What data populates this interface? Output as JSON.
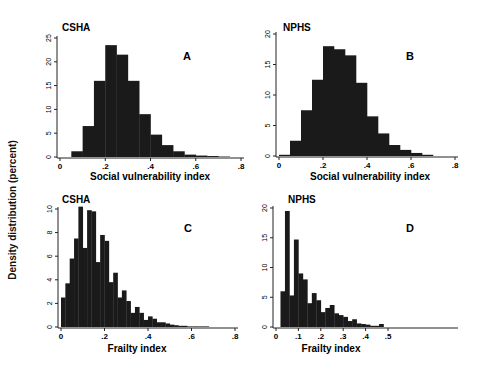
{
  "figure": {
    "ylabel": "Density distribution (percent)",
    "bar_color": "#1a1a1a",
    "axis_color": "#222222"
  },
  "chart_data": [
    {
      "type": "bar",
      "panel": "A",
      "title": "CSHA",
      "xlabel": "Social vulnerability index",
      "ylabel": "Density distribution (percent)",
      "xlim": [
        0,
        0.8
      ],
      "ylim": [
        0,
        25
      ],
      "xticks": [
        "0",
        ".2",
        ".4",
        ".6",
        ".8"
      ],
      "yticks": [
        "0",
        "5",
        "10",
        "15",
        "20",
        "25"
      ],
      "bin_width": 0.05,
      "bin_start": 0.05,
      "values": [
        1.2,
        6.5,
        16,
        23.5,
        21.5,
        16,
        9,
        4.7,
        2.5,
        1.2,
        0.5,
        0.3,
        0.2,
        0.1
      ],
      "grid": false
    },
    {
      "type": "bar",
      "panel": "B",
      "title": "NPHS",
      "xlabel": "Social vulnerability index",
      "ylabel": "Density distribution (percent)",
      "xlim": [
        0,
        0.8
      ],
      "ylim": [
        0,
        20
      ],
      "xticks": [
        "0",
        ".2",
        ".4",
        ".6",
        ".8"
      ],
      "yticks": [
        "0",
        "5",
        "10",
        "15",
        "20"
      ],
      "bin_width": 0.05,
      "bin_start": 0.0,
      "values": [
        0.2,
        2.5,
        7.5,
        12.5,
        18,
        17.5,
        16.5,
        12,
        6.5,
        3.7,
        1.8,
        1,
        0.5,
        0.2
      ],
      "grid": false
    },
    {
      "type": "bar",
      "panel": "C",
      "title": "CSHA",
      "xlabel": "Frailty index",
      "ylabel": "Density distribution (percent)",
      "xlim": [
        0,
        0.8
      ],
      "ylim": [
        0,
        10
      ],
      "xticks": [
        "0",
        ".2",
        ".4",
        ".6",
        ".8"
      ],
      "yticks": [
        "0",
        "2",
        "4",
        "6",
        "8",
        "10"
      ],
      "bin_width": 0.02,
      "bin_start": 0.0,
      "values": [
        2.5,
        3.7,
        5.8,
        7.5,
        10.2,
        6.7,
        9.9,
        9.8,
        5.5,
        7.8,
        7.3,
        3.8,
        4.6,
        2.5,
        3.1,
        2.2,
        1.2,
        1.7,
        1.2,
        0.6,
        0.9,
        0.7,
        0.4,
        0.4,
        0.3,
        0.2,
        0.15,
        0.1,
        0.1,
        0.05,
        0.05,
        0.05,
        0.05,
        0.05
      ],
      "grid": false
    },
    {
      "type": "bar",
      "panel": "D",
      "title": "NPHS",
      "xlabel": "Frailty index",
      "ylabel": "Density distribution (percent)",
      "xlim": [
        0,
        0.8
      ],
      "ylim": [
        0,
        20
      ],
      "xticks": [
        "0",
        ".1",
        ".2",
        ".3",
        ".4",
        ".5"
      ],
      "xtick_values": [
        0,
        0.1,
        0.2,
        0.3,
        0.4,
        0.5
      ],
      "yticks": [
        "0",
        "5",
        "10",
        "15",
        "20"
      ],
      "bin_width": 0.02,
      "bin_start": 0.02,
      "values": [
        6,
        19.5,
        5.3,
        14.7,
        9,
        8,
        4,
        5.7,
        4.5,
        2.5,
        3.2,
        3.7,
        2.3,
        2,
        1.7,
        1,
        1.3,
        0.6,
        0.5,
        0.4,
        0.2,
        0.2,
        0.5
      ],
      "grid": false
    }
  ],
  "panels": [
    {
      "title": "CSHA",
      "letter": "A",
      "xlabel": "Social vulnerability index"
    },
    {
      "title": "NPHS",
      "letter": "B",
      "xlabel": "Social vulnerability index"
    },
    {
      "title": "CSHA",
      "letter": "C",
      "xlabel": "Frailty index"
    },
    {
      "title": "NPHS",
      "letter": "D",
      "xlabel": "Frailty index"
    }
  ]
}
